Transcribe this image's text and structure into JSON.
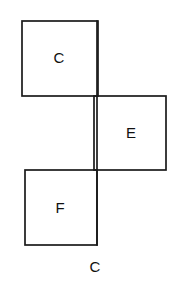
{
  "figure": {
    "background_color": "#ffffff",
    "stroke_color": "#1a1a1a",
    "stroke_width": 1.7,
    "face_color": "#ffffff",
    "canvas": {
      "width": 181,
      "height": 289
    },
    "squares": [
      {
        "id": "square-c",
        "label": "C",
        "x": 22,
        "y": 21,
        "width": 76,
        "height": 75,
        "label_x": 59,
        "label_y": 59
      },
      {
        "id": "square-e",
        "label": "E",
        "x": 94,
        "y": 96,
        "width": 72,
        "height": 74,
        "label_x": 131,
        "label_y": 134
      },
      {
        "id": "square-f",
        "label": "F",
        "x": 25,
        "y": 170,
        "width": 72,
        "height": 75,
        "label_x": 60,
        "label_y": 209
      }
    ],
    "shared_vertical_line": {
      "id": "shared-edge",
      "x": 97,
      "y_start": 21,
      "y_end": 245
    },
    "caption": {
      "text": "C",
      "x": 95,
      "y": 268
    }
  }
}
